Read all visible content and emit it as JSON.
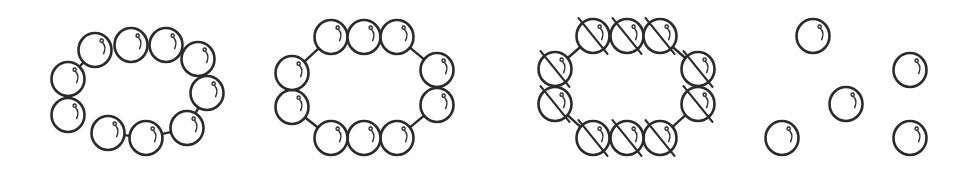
{
  "colors": {
    "stroke": "#2b2b2b",
    "fill": "#ffffff",
    "background": "#ffffff"
  },
  "bead_radius": 17,
  "figures": [
    {
      "id": "ring-10-oval",
      "description": "ring of 10 beads in oval arrangement",
      "beads": [
        [
          95,
          50
        ],
        [
          131,
          45
        ],
        [
          166,
          45
        ],
        [
          198,
          59
        ],
        [
          207,
          93
        ],
        [
          187,
          128
        ],
        [
          146,
          138
        ],
        [
          108,
          133
        ],
        [
          68,
          115
        ],
        [
          68,
          79
        ]
      ],
      "bonds": [
        [
          9,
          0
        ],
        [
          7,
          6
        ],
        [
          6,
          5
        ],
        [
          4,
          5
        ]
      ],
      "slashed": false
    },
    {
      "id": "ring-10-rect",
      "description": "ring of 10 beads in rounded rectangle arrangement",
      "beads": [
        [
          331,
          37
        ],
        [
          364,
          37
        ],
        [
          397,
          37
        ],
        [
          437,
          70
        ],
        [
          437,
          105
        ],
        [
          397,
          138
        ],
        [
          364,
          138
        ],
        [
          331,
          138
        ],
        [
          292,
          107
        ],
        [
          292,
          73
        ]
      ],
      "bonds": [
        [
          9,
          0
        ],
        [
          2,
          3
        ],
        [
          4,
          5
        ],
        [
          7,
          8
        ]
      ],
      "slashed": false
    },
    {
      "id": "ring-10-rect-slashed",
      "description": "ring of 10 slashed beads in rounded rectangle arrangement",
      "beads": [
        [
          593,
          36
        ],
        [
          627,
          36
        ],
        [
          660,
          36
        ],
        [
          698,
          69
        ],
        [
          698,
          104
        ],
        [
          660,
          138
        ],
        [
          627,
          138
        ],
        [
          593,
          138
        ],
        [
          555,
          104
        ],
        [
          555,
          69
        ]
      ],
      "bonds": [
        [
          9,
          0
        ],
        [
          2,
          3
        ],
        [
          4,
          5
        ],
        [
          7,
          8
        ]
      ],
      "slashed": true
    },
    {
      "id": "free-beads",
      "description": "five separated free beads",
      "beads": [
        [
          813,
          36
        ],
        [
          910,
          70
        ],
        [
          846,
          104
        ],
        [
          782,
          138
        ],
        [
          910,
          138
        ]
      ],
      "bonds": [],
      "slashed": false
    }
  ]
}
